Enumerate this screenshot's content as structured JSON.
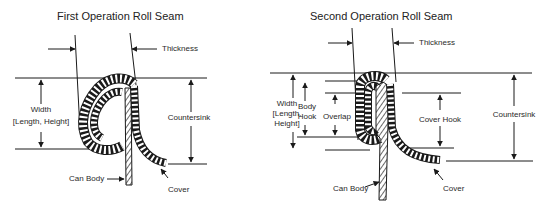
{
  "diagrams": [
    {
      "title": "First Operation Roll Seam",
      "labels": {
        "thickness": "Thickness",
        "width_line1": "Width",
        "width_line2": "[Length, Height]",
        "countersink": "Countersink",
        "can_body": "Can Body",
        "cover": "Cover"
      }
    },
    {
      "title": "Second Operation Roll Seam",
      "labels": {
        "thickness": "Thickness",
        "width_line1": "Width",
        "width_line2": "[Length,",
        "width_line3": "Height]",
        "body_hook_line1": "Body",
        "body_hook_line2": "Hook",
        "overlap": "Overlap",
        "cover_hook": "Cover Hook",
        "countersink": "Countersink",
        "can_body": "Can Body",
        "cover": "Cover"
      }
    }
  ],
  "colors": {
    "line": "#1a1a1a",
    "text": "#2a2a2a",
    "background": "#ffffff"
  }
}
